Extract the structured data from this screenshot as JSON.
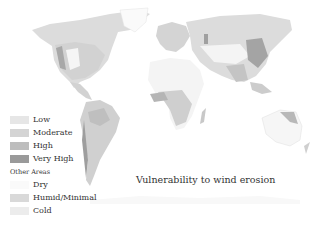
{
  "title": "Vulnerability to wind erosion",
  "legend": {
    "classes": [
      {
        "label": "Low",
        "color": "#e6e6e6"
      },
      {
        "label": "Moderate",
        "color": "#d4d4d4"
      },
      {
        "label": "High",
        "color": "#bdbdbd"
      },
      {
        "label": "Very High",
        "color": "#9a9a9a"
      }
    ],
    "other_heading": "Other Areas",
    "other": [
      {
        "label": "Dry",
        "color": "#fafafa"
      },
      {
        "label": "Humid/Minimal",
        "color": "#d9d9d9"
      },
      {
        "label": "Cold",
        "color": "#ececec"
      }
    ]
  },
  "colors": {
    "background": "#ffffff",
    "land_base": "#ececec",
    "moderate": "#d4d4d4",
    "high": "#bdbdbd",
    "very_high": "#9a9a9a",
    "dry": "#f7f7f7"
  }
}
